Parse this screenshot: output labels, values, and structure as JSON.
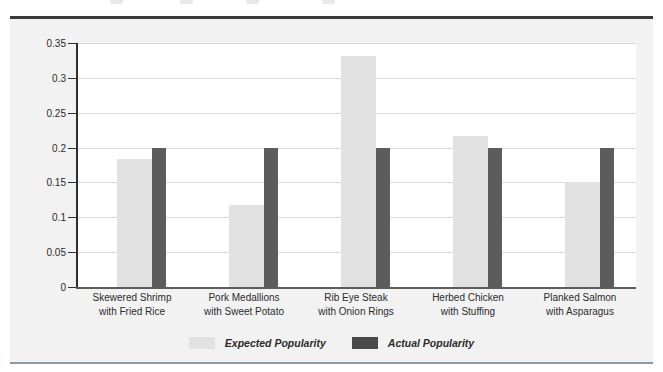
{
  "chart_data": {
    "type": "bar",
    "title": "",
    "subtitle": "",
    "xlabel": "",
    "ylabel": "",
    "ylim": [
      0,
      0.35
    ],
    "yticks": [
      "0",
      "0.05",
      "0.1",
      "0.15",
      "0.2",
      "0.25",
      "0.3",
      "0.35"
    ],
    "ytick_values": [
      0,
      0.05,
      0.1,
      0.15,
      0.2,
      0.25,
      0.3,
      0.35
    ],
    "grid": true,
    "legend_position": "bottom-center",
    "categories": [
      "Skewered Shrimp\nwith Fried Rice",
      "Pork Medallions\nwith Sweet Potato",
      "Rib Eye Steak\nwith Onion Rings",
      "Herbed Chicken\nwith Stuffing",
      "Planked Salmon\nwith Asparagus"
    ],
    "category_lines": [
      [
        "Skewered Shrimp",
        "with Fried Rice"
      ],
      [
        "Pork Medallions",
        "with Sweet Potato"
      ],
      [
        "Rib Eye Steak",
        "with Onion Rings"
      ],
      [
        "Herbed Chicken",
        "with Stuffing"
      ],
      [
        "Planked Salmon",
        "with Asparagus"
      ]
    ],
    "series": [
      {
        "name": "Expected Popularity",
        "color": "#e2e2e2",
        "values": [
          0.183,
          0.118,
          0.331,
          0.216,
          0.151
        ]
      },
      {
        "name": "Actual Popularity",
        "color": "#5c5c5c",
        "values": [
          0.2,
          0.2,
          0.2,
          0.2,
          0.2
        ]
      }
    ]
  },
  "legend": {
    "items": [
      {
        "label": "Expected Popularity",
        "swatch": "expected"
      },
      {
        "label": "Actual Popularity",
        "swatch": "actual"
      }
    ]
  },
  "colors": {
    "panel_background": "#f2f2f2",
    "plot_background": "#ffffff",
    "axis": "#2f2f2f",
    "gridline": "#d9d9d9",
    "top_rule": "#3a3a3a",
    "bottom_rule": "#8a99a8",
    "expected_bar": "#e2e2e2",
    "actual_bar": "#5c5c5c"
  }
}
